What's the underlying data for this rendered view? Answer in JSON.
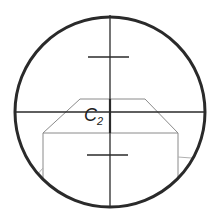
{
  "diagram": {
    "type": "reticle-view",
    "label": {
      "main": "C",
      "subscript": "2"
    },
    "colors": {
      "background": "#ffffff",
      "circle": "#2a2a2a",
      "crosshair": "#2a2a2a",
      "outline": "#8a8a8a"
    },
    "circle": {
      "cx": 110,
      "cy": 112,
      "r": 95
    },
    "crosshair": {
      "x": 110,
      "y": 112
    },
    "ticks": [
      {
        "name": "upper-tick",
        "y": 57,
        "x1": 88,
        "x2": 129
      },
      {
        "name": "lower-tick",
        "y": 155,
        "x1": 87,
        "x2": 128
      }
    ]
  }
}
